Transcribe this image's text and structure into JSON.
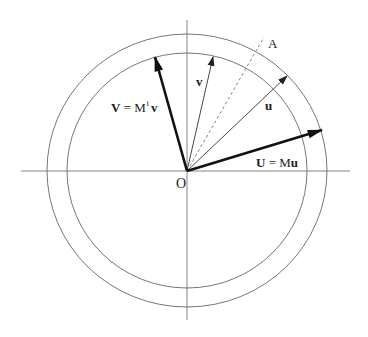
{
  "figure": {
    "labels": {
      "V_vec": "V",
      "V_eq": " = M",
      "V_sup": "t",
      "V_rhs": "v",
      "U_vec": "U",
      "U_eq": " = M",
      "U_rhs": "u",
      "v_vec": "v",
      "u_vec": "u",
      "A": "A",
      "O": "O"
    },
    "colors": {
      "line": "#555555",
      "heavy_arrow": "#111111",
      "background": "#ffffff"
    },
    "geometry": {
      "origin": [
        187,
        171
      ],
      "inner_circle": {
        "rx": 120,
        "ry": 117.5
      },
      "outer_circle": {
        "rx": 140,
        "ry": 136.5
      },
      "arrows": [
        {
          "name": "V = M^t v",
          "tip": [
            155,
            57
          ],
          "weight": "heavy"
        },
        {
          "name": "v",
          "tip": [
            213,
            57
          ],
          "weight": "light"
        },
        {
          "name": "u",
          "tip": [
            287,
            76
          ],
          "weight": "light"
        },
        {
          "name": "U = Mu",
          "tip": [
            322,
            130
          ],
          "weight": "heavy"
        }
      ],
      "dashed_line_A": {
        "end": [
          264,
          37
        ]
      }
    }
  }
}
